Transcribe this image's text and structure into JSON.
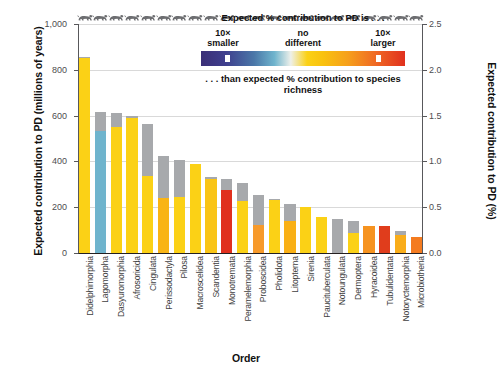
{
  "chart_data": {
    "type": "bar",
    "title": "",
    "xlabel": "Order",
    "ylabel": "Expected contribution to PD (millions of years)",
    "ylabel_right": "Expected contribution to PD (%)",
    "ylim": [
      0,
      1000
    ],
    "ylim_right": [
      0.0,
      2.5
    ],
    "yticks": [
      "0",
      "200",
      "400",
      "600",
      "800",
      "1,000"
    ],
    "yticks_right": [
      "0.0",
      "0.5",
      "1.0",
      "1.5",
      "2.0",
      "2.5"
    ],
    "grid": true,
    "legend_position": "top-right",
    "categories": [
      "Didelphimorphia",
      "Lagomorpha",
      "Dasyuromorphia",
      "Afrosoricida",
      "Cingulata",
      "Perissodactyla",
      "Pilosa",
      "Macroscelidea",
      "Scandentia",
      "Monotremata",
      "Peramelemorphia",
      "Proboscidea",
      "Pholidota",
      "Litopterna",
      "Sirenia",
      "Paucituberculata",
      "Notoungulata",
      "Dermoptera",
      "Hyracoidea",
      "Tubulidentata",
      "Notoryctemorphia",
      "Microbiotheria"
    ],
    "series": [
      {
        "name": "Expected contribution to PD (millions of years)",
        "values": [
          855,
          615,
          613,
          600,
          563,
          425,
          408,
          390,
          330,
          325,
          305,
          255,
          235,
          215,
          200,
          160,
          150,
          140,
          120,
          118,
          95,
          70
        ]
      },
      {
        "name": "Colored (extant) portion",
        "values": [
          850,
          535,
          550,
          590,
          335,
          240,
          245,
          388,
          325,
          273,
          225,
          122,
          232,
          138,
          200,
          158,
          148,
          88,
          118,
          118,
          80,
          68
        ]
      }
    ],
    "bar_colors": [
      "#fbd116",
      "#6fb4cd",
      "#fbd116",
      "#fbd116",
      "#fbd116",
      "#f9b415",
      "#fbd116",
      "#fbd116",
      "#f9c415",
      "#e0301e",
      "#fbd116",
      "#f79a2b",
      "#fbd116",
      "#f9b016",
      "#fbd116",
      "#fbd116",
      "#a7a9ac",
      "#fbd116",
      "#f69320",
      "#e03d1c",
      "#f9ad1a",
      "#f47b20"
    ],
    "critters": [
      "opossum",
      "rabbit",
      "quoll",
      "tenrec",
      "armadillo",
      "tapir",
      "sloth",
      "elephant-shrew",
      "treeshrew",
      "echidna",
      "bandicoot",
      "elephant",
      "pangolin",
      "litoptern",
      "manatee",
      "shrew-opossum",
      "notoungulate",
      "colugo",
      "hyrax",
      "aardvark",
      "marsupial-mole",
      "monito"
    ]
  },
  "legend": {
    "top_text": "Expected % contribution to PD is . . .",
    "bottom_text": ". . . than expected % contribution to species richness",
    "labels": [
      {
        "line1": "10×",
        "line2": "smaller"
      },
      {
        "line1": "no",
        "line2": "different"
      },
      {
        "line1": "10×",
        "line2": "larger"
      }
    ],
    "colors": {
      "smaller": "#3b2f77",
      "neutral": "#eef0ea",
      "larger": "#e0301e",
      "gray": "#a7a9ac"
    }
  }
}
